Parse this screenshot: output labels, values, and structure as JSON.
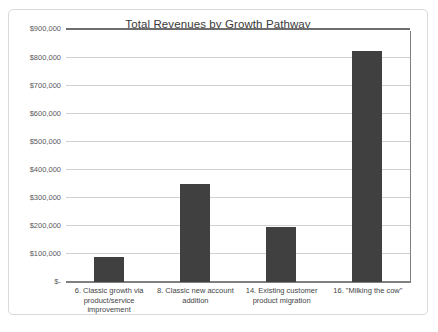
{
  "chart_data": {
    "type": "bar",
    "title": "Total Revenues by Growth Pathway",
    "xlabel": "",
    "ylabel": "",
    "categories": [
      "6. Classic growth via product/service improvement",
      "8. Classic new account addition",
      "14. Existing customer product migration",
      "16. \"Milking the cow\""
    ],
    "values": [
      88000,
      350000,
      195000,
      825000
    ],
    "ylim": [
      0,
      900000
    ],
    "ytick_values": [
      0,
      100000,
      200000,
      300000,
      400000,
      500000,
      600000,
      700000,
      800000,
      900000
    ],
    "ytick_labels": [
      "$-",
      "$100,000",
      "$200,000",
      "$300,000",
      "$400,000",
      "$500,000",
      "$600,000",
      "$700,000",
      "$800,000",
      "$900,000"
    ],
    "grid": true,
    "legend": false,
    "bar_color": "#404040",
    "gridline_color": "#d0d0d0",
    "axis_color": "#808080",
    "frame_color": "#d9d9d9"
  }
}
